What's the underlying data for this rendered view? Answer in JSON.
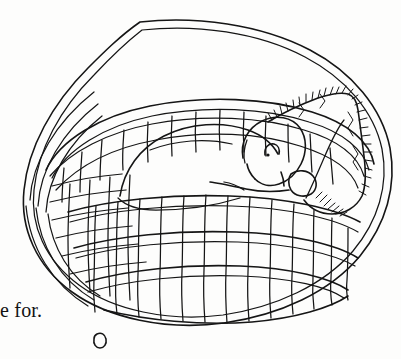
{
  "page": {
    "background_color": "#fdfdfc",
    "ink_color": "#151515",
    "caption": "e for."
  },
  "illustration": {
    "title": "Sleeping puppy in a woven basket",
    "medium": "pen-and-ink line drawing",
    "subject_label": "puppy",
    "container_label": "woven oval basket",
    "blanket_label": "fringed blanket",
    "parts": {
      "outer_rim": "basket-outer-rim",
      "inner_rim": "basket-inner-rim",
      "weave": "basket-weave",
      "body": "puppy-body",
      "head": "puppy-head",
      "eye": "puppy-eye",
      "snout": "puppy-snout",
      "muzzle_line": "puppy-muzzle-line",
      "blanket": "blanket-shape",
      "fringe": "blanket-fringe"
    }
  },
  "marker": {
    "label": "page-marker-circle"
  }
}
